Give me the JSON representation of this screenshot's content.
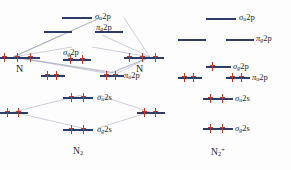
{
  "colors": {
    "level_bar": "#2f3a66",
    "electron": "#c0392b",
    "connector": "#9aa0b4",
    "text": "#1d1d1d",
    "background": "#fdfdfd"
  },
  "left_panel": {
    "molecule_label": "N",
    "molecule_sub": "2",
    "atom_left_label": "N",
    "atom_right_label": "N",
    "atomic_levels": [
      {
        "name": "left-2p",
        "electrons": 3,
        "paired": false
      },
      {
        "name": "right-2p",
        "electrons": 3,
        "paired": false
      },
      {
        "name": "left-2s",
        "electrons": 2,
        "paired": true
      },
      {
        "name": "right-2s",
        "electrons": 2,
        "paired": true
      }
    ],
    "mo_levels": [
      {
        "id": "sigma-u-2p",
        "label_greek": "σ",
        "label_sub": "u",
        "label_rest": "2p",
        "electrons": 0,
        "slots": 1
      },
      {
        "id": "pi-g-2p",
        "label_greek": "π",
        "label_sub": "g",
        "label_rest": "2p",
        "electrons": 0,
        "slots": 2
      },
      {
        "id": "sigma-g-2p",
        "label_greek": "σ",
        "label_sub": "g",
        "label_rest": "2p",
        "electrons": 2,
        "slots": 1
      },
      {
        "id": "pi-u-2p",
        "label_greek": "π",
        "label_sub": "u",
        "label_rest": "2p",
        "electrons": 4,
        "slots": 2
      },
      {
        "id": "sigma-u-2s",
        "label_greek": "σ",
        "label_sub": "u",
        "label_rest": "2s",
        "electrons": 2,
        "slots": 1
      },
      {
        "id": "sigma-g-2s",
        "label_greek": "σ",
        "label_sub": "g",
        "label_rest": "2s",
        "electrons": 2,
        "slots": 1
      }
    ]
  },
  "right_panel": {
    "molecule_label": "N",
    "molecule_sub": "2",
    "molecule_sup": "+",
    "mo_levels": [
      {
        "id": "sigma-u-2p",
        "label_greek": "σ",
        "label_sub": "u",
        "label_rest": "2p",
        "electrons": 0,
        "slots": 1
      },
      {
        "id": "pi-g-2p",
        "label_greek": "π",
        "label_sub": "g",
        "label_rest": "2p",
        "electrons": 0,
        "slots": 2
      },
      {
        "id": "sigma-g-2p",
        "label_greek": "σ",
        "label_sub": "g",
        "label_rest": "2p",
        "electrons": 1,
        "slots": 1
      },
      {
        "id": "pi-u-2p",
        "label_greek": "π",
        "label_sub": "u",
        "label_rest": "2p",
        "electrons": 4,
        "slots": 2
      },
      {
        "id": "sigma-u-2s",
        "label_greek": "σ",
        "label_sub": "u",
        "label_rest": "2s",
        "electrons": 2,
        "slots": 1
      },
      {
        "id": "sigma-g-2s",
        "label_greek": "σ",
        "label_sub": "g",
        "label_rest": "2s",
        "electrons": 2,
        "slots": 1
      }
    ]
  }
}
